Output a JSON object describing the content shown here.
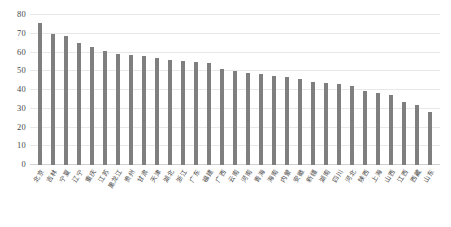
{
  "chart_data": {
    "type": "bar",
    "title": "",
    "subtitle": "",
    "xlabel": "",
    "ylabel": "",
    "ylim": [
      0,
      80
    ],
    "yticks": [
      0,
      10,
      20,
      30,
      40,
      50,
      60,
      70,
      80
    ],
    "grid": true,
    "legend": "none",
    "series_color": "#7f7f7f",
    "categories": [
      "北京",
      "吉林",
      "宁夏",
      "辽宁",
      "重庆",
      "江苏",
      "黑龙江",
      "贵州",
      "甘肃",
      "天津",
      "湖北",
      "浙江",
      "广东",
      "福建",
      "广西",
      "云南",
      "河南",
      "青海",
      "海南",
      "内蒙",
      "安徽",
      "新疆",
      "湖南",
      "四川",
      "河北",
      "陕西",
      "上海",
      "山西",
      "江西",
      "西藏",
      "山东"
    ],
    "values": [
      75.5,
      70.0,
      69.0,
      65.0,
      63.0,
      61.0,
      59.0,
      58.5,
      58.0,
      57.0,
      56.0,
      55.5,
      55.0,
      54.5,
      51.0,
      50.0,
      49.0,
      48.5,
      47.5,
      47.0,
      45.8,
      44.2,
      43.8,
      43.3,
      42.0,
      39.6,
      38.5,
      37.6,
      33.5,
      32.0,
      28.2
    ],
    "series": [
      {
        "name": "series-1",
        "values": [
          75.5,
          70.0,
          69.0,
          65.0,
          63.0,
          61.0,
          59.0,
          58.5,
          58.0,
          57.0,
          56.0,
          55.5,
          55.0,
          54.5,
          51.0,
          50.0,
          49.0,
          48.5,
          47.5,
          47.0,
          45.8,
          44.2,
          43.8,
          43.3,
          42.0,
          39.6,
          38.5,
          37.6,
          33.5,
          32.0,
          28.2
        ]
      }
    ]
  }
}
